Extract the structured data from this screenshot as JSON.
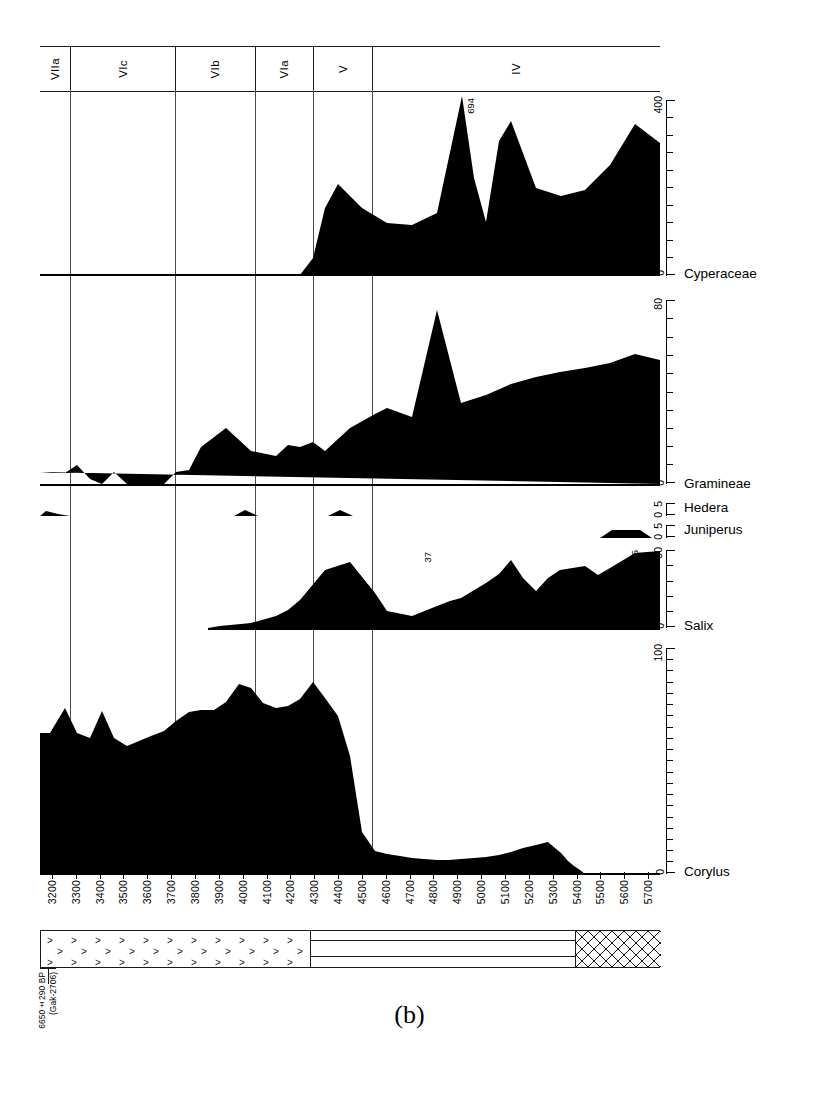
{
  "figure": {
    "caption": "(b)",
    "type": "pollen-percentage-diagram"
  },
  "zones": {
    "axis_label": "pollen zones",
    "items": [
      {
        "label": "VIIa",
        "x_start": 40,
        "x_end": 70
      },
      {
        "label": "VIc",
        "x_start": 70,
        "x_end": 175
      },
      {
        "label": "VIb",
        "x_start": 175,
        "x_end": 255
      },
      {
        "label": "VIa",
        "x_start": 255,
        "x_end": 313
      },
      {
        "label": "V",
        "x_start": 313,
        "x_end": 372
      },
      {
        "label": "IV",
        "x_start": 372,
        "x_end": 660
      }
    ]
  },
  "radiocarbon_date": {
    "value": "6650±290 BP",
    "lab_code": "(Gak-2706)"
  },
  "xaxis": {
    "label": "years BP",
    "ticks": [
      "3200",
      "3300",
      "3400",
      "3500",
      "3600",
      "3700",
      "3800",
      "3900",
      "4000",
      "4100",
      "4200",
      "4300",
      "4400",
      "4500",
      "4600",
      "4700",
      "4800",
      "4900",
      "5000",
      "5100",
      "5200",
      "5300",
      "5400",
      "5500",
      "5600",
      "5700"
    ],
    "min": 3200,
    "max": 5700
  },
  "stratigraphy": {
    "segments": [
      {
        "name": "detritus-peat",
        "pattern": "chevron",
        "x_start": 40,
        "x_end": 310
      },
      {
        "name": "clay-gyttja",
        "pattern": "horizontal-lines",
        "x_start": 310,
        "x_end": 575
      },
      {
        "name": "coarse-detritus",
        "pattern": "crosshatch",
        "x_start": 575,
        "x_end": 660
      }
    ]
  },
  "chart_data": [
    {
      "type": "area",
      "taxon": "Cyperaceae",
      "ylabel": "Cyperaceae",
      "ylim": [
        0,
        400
      ],
      "yticks": [
        0,
        400
      ],
      "minor_tick_step": 40,
      "annotations": [
        {
          "text": "694",
          "x": 4900
        }
      ],
      "x": [
        3200,
        3300,
        3400,
        3500,
        3600,
        3700,
        3800,
        3900,
        4000,
        4100,
        4200,
        4250,
        4300,
        4350,
        4400,
        4500,
        4600,
        4700,
        4800,
        4900,
        4950,
        5000,
        5050,
        5100,
        5200,
        5300,
        5400,
        5500,
        5600,
        5700
      ],
      "values": [
        0,
        0,
        0,
        0,
        0,
        0,
        0,
        0,
        0,
        0,
        0,
        2,
        40,
        150,
        205,
        150,
        122,
        118,
        140,
        400,
        215,
        120,
        300,
        350,
        195,
        170,
        185,
        230,
        300,
        262
      ]
    },
    {
      "type": "area",
      "taxon": "Gramineae",
      "ylabel": "Gramineae",
      "ylim": [
        0,
        80
      ],
      "yticks": [
        0,
        80
      ],
      "minor_tick_step": 8,
      "annotations": [],
      "x": [
        3200,
        3300,
        3400,
        3500,
        3600,
        3700,
        3800,
        3900,
        4000,
        4100,
        4200,
        4300,
        4400,
        4500,
        4600,
        4700,
        4800,
        4900,
        5000,
        5100,
        5200,
        5300,
        5400,
        5500,
        5600,
        5700
      ],
      "values": [
        5,
        4,
        4,
        8,
        2,
        0,
        5,
        0,
        0,
        0,
        5,
        6,
        16,
        22,
        14,
        12,
        17,
        16,
        18,
        14,
        22,
        28,
        30,
        26,
        72,
        34
      ]
    },
    {
      "type": "area",
      "taxon": "Hedera",
      "ylabel": "Hedera",
      "ylim": [
        0,
        5
      ],
      "yticks": [
        0,
        5
      ],
      "minor_tick_step": 5,
      "annotations": [],
      "x": [
        3200,
        3300,
        3400,
        3500,
        3600,
        3700,
        3800,
        3900,
        4000,
        4100,
        4200,
        4300,
        4400,
        4500,
        4600,
        4700,
        4800,
        4900,
        5000,
        5100,
        5200,
        5300,
        5400,
        5500,
        5600,
        5700
      ],
      "values": [
        1.5,
        0,
        0,
        0,
        0,
        0,
        2,
        0,
        0,
        0,
        0,
        2,
        0,
        0,
        0,
        0,
        0,
        0,
        0,
        0,
        0,
        0,
        0,
        0,
        0,
        0
      ]
    },
    {
      "type": "area",
      "taxon": "Juniperus",
      "ylabel": "Juniperus",
      "ylim": [
        0,
        5
      ],
      "yticks": [
        0,
        5
      ],
      "minor_tick_step": 5,
      "annotations": [],
      "x": [
        3200,
        3300,
        3400,
        3500,
        3600,
        3700,
        3800,
        3900,
        4000,
        4100,
        4200,
        4300,
        4400,
        4500,
        4600,
        4700,
        4800,
        4900,
        5000,
        5100,
        5200,
        5300,
        5400,
        5500,
        5600,
        5700
      ],
      "values": [
        0,
        0,
        0,
        0,
        0,
        0,
        0,
        0,
        0,
        0,
        0,
        0,
        0,
        0,
        0,
        0,
        0,
        0,
        0,
        0,
        0,
        0,
        0,
        2.5,
        2.5,
        0
      ]
    },
    {
      "type": "area",
      "taxon": "Salix",
      "ylabel": "Salix",
      "ylim": [
        0,
        30
      ],
      "yticks": [
        0,
        30
      ],
      "minor_tick_step": 6,
      "annotations": [
        {
          "text": "37",
          "x": 4800
        },
        {
          "text": "35",
          "x": 5600
        }
      ],
      "x": [
        3200,
        3300,
        3400,
        3500,
        3600,
        3700,
        3800,
        3900,
        4000,
        4100,
        4200,
        4300,
        4400,
        4500,
        4600,
        4700,
        4800,
        4900,
        5000,
        5100,
        5200,
        5300,
        5400,
        5500,
        5600,
        5700
      ],
      "values": [
        0,
        0,
        0,
        0,
        0,
        0,
        0,
        0,
        0,
        0,
        0,
        1,
        2,
        5,
        7,
        10,
        11,
        12,
        12,
        18,
        30,
        16,
        24,
        22,
        28,
        30
      ]
    },
    {
      "type": "area",
      "taxon": "Corylus",
      "ylabel": "Corylus",
      "ylim": [
        0,
        100
      ],
      "yticks": [
        0,
        100
      ],
      "minor_tick_step": 5,
      "annotations": [],
      "x": [
        3200,
        3250,
        3300,
        3400,
        3500,
        3600,
        3700,
        3800,
        3900,
        4000,
        4100,
        4200,
        4300,
        4400,
        4500,
        4600,
        4700,
        4800,
        4900,
        5000,
        5100,
        5200,
        5300,
        5400,
        5500,
        5600,
        5700
      ],
      "values": [
        62,
        84,
        60,
        86,
        52,
        58,
        70,
        78,
        90,
        74,
        64,
        85,
        48,
        10,
        5,
        4,
        4,
        5,
        6,
        7,
        10,
        11,
        0,
        0,
        0,
        0,
        0
      ]
    }
  ]
}
